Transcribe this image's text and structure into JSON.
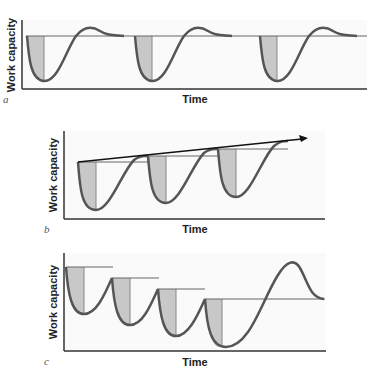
{
  "figure": {
    "panels": [
      {
        "id": "a",
        "label": "a",
        "ylabel": "Work capacity",
        "xlabel": "Time",
        "description": "Repeated dips and recovery to same baseline"
      },
      {
        "id": "b",
        "label": "b",
        "ylabel": "Work capacity",
        "xlabel": "Time",
        "description": "Supercompensation: each recovery exceeds previous baseline, rising trend arrow"
      },
      {
        "id": "c",
        "label": "c",
        "ylabel": "Work capacity",
        "xlabel": "Time",
        "description": "Declining baselines with incomplete recovery, then large final supercompensation peak"
      }
    ]
  },
  "colors": {
    "curve": "#555555",
    "shade": "#c8c8c8",
    "axis": "#333333",
    "baseline": "#666666",
    "arrow": "#111111",
    "plot_bg": "#f9f9f9"
  }
}
